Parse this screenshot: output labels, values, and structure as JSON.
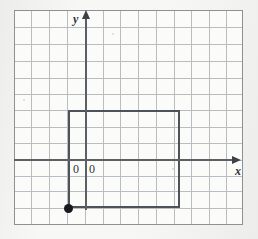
{
  "figure": {
    "background_color": "#f4f4f2",
    "grid_paper_color": "#fbfbfa",
    "grid_line_color": "#b9bcc0",
    "grid_border_color": "#8d9196",
    "axis_color": "#5b6066",
    "shape_color": "#4e5359",
    "point_color": "#17191c"
  },
  "grid": {
    "columns": 13,
    "rows": 13,
    "cell_size_px": 17.6,
    "left_px": 14,
    "top_px": 10,
    "width_px": 229,
    "height_px": 215
  },
  "axes": {
    "x_label": "x",
    "y_label": "y",
    "x_axis_row_index": 8,
    "y_axis_col_index": 4,
    "x_axis_y_px": 160,
    "y_axis_x_px": 86,
    "origin_labels": [
      "0",
      "0"
    ]
  },
  "shape": {
    "name": "rectangle",
    "left_px": 68,
    "top_px": 110,
    "right_px": 180,
    "bottom_px": 208,
    "width_cells": 6,
    "height_cells": 5.5
  },
  "point": {
    "name": "marked-vertex",
    "x_px": 68,
    "y_px": 208,
    "description": "filled dot at bottom-left vertex of rectangle"
  }
}
